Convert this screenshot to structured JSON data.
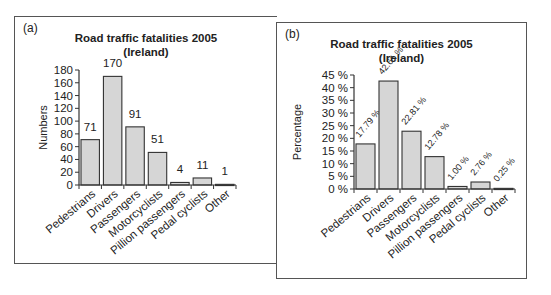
{
  "panels": [
    {
      "tag": "(a)",
      "title_line1": "Road traffic fatalities 2005",
      "title_line2": "(Ireland)",
      "ylabel": "Numbers"
    },
    {
      "tag": "(b)",
      "title_line1": "Road traffic fatalities 2005",
      "title_line2": "(Ireland)",
      "ylabel": "Percentage"
    }
  ],
  "colors": {
    "bar_fill": "#d6d6d6",
    "bar_stroke": "#333333",
    "frame": "#555555",
    "text": "#222222"
  },
  "chart_data": [
    {
      "type": "bar",
      "title": "Road traffic fatalities 2005 (Ireland)",
      "panel_label": "(a)",
      "xlabel": "",
      "ylabel": "Numbers",
      "categories": [
        "Pedestrians",
        "Drivers",
        "Passengers",
        "Motorcyclists",
        "Pillion passengers",
        "Pedal cyclists",
        "Other"
      ],
      "values": [
        71,
        170,
        91,
        51,
        4,
        11,
        1
      ],
      "data_labels": [
        "71",
        "170",
        "91",
        "51",
        "4",
        "11",
        "1"
      ],
      "ylim": [
        0,
        180
      ],
      "yticks": [
        0,
        20,
        40,
        60,
        80,
        100,
        120,
        140,
        160,
        180
      ],
      "ytick_labels": [
        "0",
        "20",
        "40",
        "60",
        "80",
        "100",
        "120",
        "140",
        "160",
        "180"
      ],
      "grid": false,
      "legend": null
    },
    {
      "type": "bar",
      "title": "Road traffic fatalities 2005 (Ireland)",
      "panel_label": "(b)",
      "xlabel": "",
      "ylabel": "Percentage",
      "categories": [
        "Pedestrians",
        "Drivers",
        "Passengers",
        "Motorcyclists",
        "Pillion passengers",
        "Pedal cyclists",
        "Other"
      ],
      "values": [
        17.79,
        42.61,
        22.81,
        12.78,
        1.0,
        2.76,
        0.25
      ],
      "data_labels": [
        "17.79 %",
        "42.61 %",
        "22.81 %",
        "12.78 %",
        "1.00 %",
        "2.76 %",
        "0.25 %"
      ],
      "ylim": [
        0,
        45
      ],
      "yticks": [
        0,
        5,
        10,
        15,
        20,
        25,
        30,
        35,
        40,
        45
      ],
      "ytick_labels": [
        "0 %",
        "5 %",
        "10 %",
        "15 %",
        "20 %",
        "25 %",
        "30 %",
        "35 %",
        "40 %",
        "45 %"
      ],
      "grid": false,
      "legend": null
    }
  ]
}
